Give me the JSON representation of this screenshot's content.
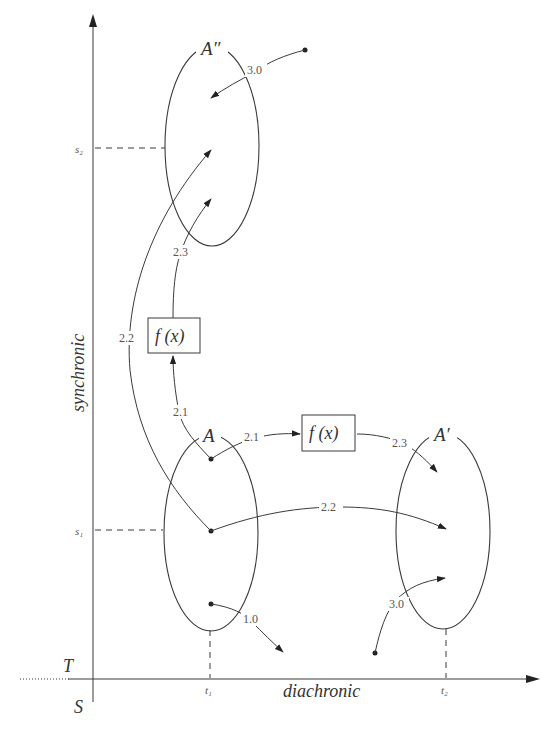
{
  "diagram": {
    "axes": {
      "vertical_label": "synchronic",
      "horizontal_label": "diachronic",
      "corner_top": "T",
      "corner_bottom": "S"
    },
    "ticks": {
      "s1": "s₁",
      "s2": "s₂",
      "t1": "t₁",
      "t2": "t₂"
    },
    "sets": {
      "A": "A",
      "A_prime": "A′",
      "A_double_prime": "A″"
    },
    "function_boxes": {
      "vertical": "f (x)",
      "horizontal": "f (x)"
    },
    "arrow_labels": {
      "a_1_0": "1.0",
      "a_2_1_vertical": "2.1",
      "a_2_1_horizontal": "2.1",
      "a_2_2_vertical": "2.2",
      "a_2_2_horizontal": "2.2",
      "a_2_3_vertical": "2.3",
      "a_2_3_horizontal": "2.3",
      "a_3_0_top": "3.0",
      "a_3_0_bottom": "3.0"
    }
  }
}
